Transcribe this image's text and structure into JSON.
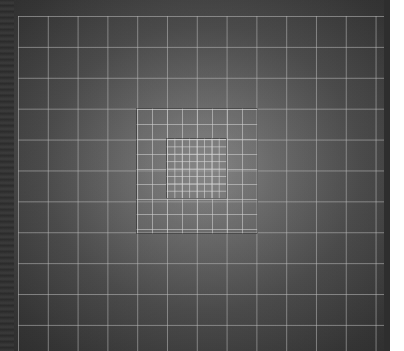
{
  "image": {
    "description": "Nested square grid pattern on dark radial gradient background",
    "width": 404,
    "height": 351,
    "content_width": 390
  },
  "colors": {
    "background_center": "#8a8a8a",
    "background_edge": "#2b2b2b",
    "grid_line": "#bebebe",
    "margin": "#ffffff"
  },
  "grids": {
    "outer": {
      "x": 18,
      "y": 16,
      "cell_w": 29.8,
      "cell_h": 30.9,
      "columns": 13,
      "rows": 11
    },
    "middle": {
      "x": 136,
      "y": 108,
      "width": 120,
      "height": 124,
      "cell": 15
    },
    "inner": {
      "x": 166,
      "y": 138,
      "width": 59,
      "height": 59,
      "cell": 7.4
    }
  }
}
